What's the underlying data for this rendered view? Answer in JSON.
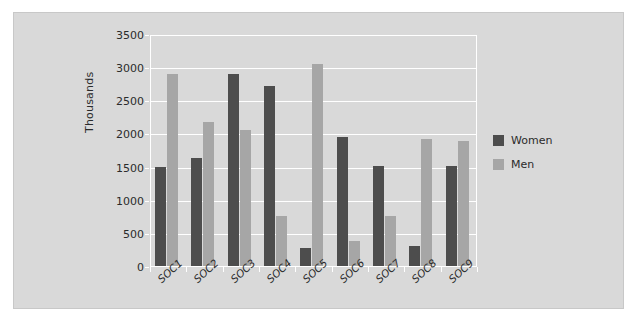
{
  "chart_data": {
    "type": "bar",
    "title": "",
    "xlabel": "",
    "ylabel": "Thousands",
    "categories": [
      "SOC1",
      "SOC2",
      "SOC3",
      "SOC4",
      "SOC5",
      "SOC6",
      "SOC7",
      "SOC8",
      "SOC9"
    ],
    "series": [
      {
        "name": "Women",
        "color": "#4d4d4d",
        "values": [
          1500,
          1630,
          2900,
          2710,
          270,
          1950,
          1510,
          300,
          1510
        ]
      },
      {
        "name": "Men",
        "color": "#a6a6a6",
        "values": [
          2900,
          2170,
          2050,
          750,
          3050,
          370,
          760,
          1920,
          1880
        ]
      }
    ],
    "ylim": [
      0,
      3500
    ],
    "ytick_values": [
      0,
      500,
      1000,
      1500,
      2000,
      2500,
      3000,
      3500
    ],
    "ytick_labels": [
      "0",
      "500",
      "1000",
      "1500",
      "2000",
      "2500",
      "3000",
      "3500"
    ],
    "grid": true,
    "grid_color": "#ffffff",
    "legend_position": "right",
    "plot_background": "#d9d9d9",
    "figure_background": "#d9d9d9",
    "page_background": "#ffffff"
  },
  "legend": {
    "entries": [
      {
        "label": "Women",
        "color": "#4d4d4d"
      },
      {
        "label": "Men",
        "color": "#a6a6a6"
      }
    ]
  }
}
